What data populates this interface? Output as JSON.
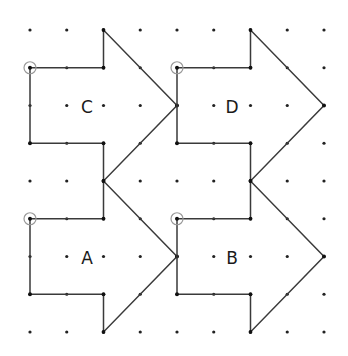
{
  "diagram": {
    "type": "dot-grid-shapes",
    "grid": {
      "columns": 9,
      "rows": 9,
      "origin_px": [
        30,
        30
      ],
      "step_px": [
        36.75,
        37.75
      ],
      "dot_color": "#222222"
    },
    "line_color": "#3a3a3a",
    "marker_color": "#9a9a9a",
    "shapes": [
      {
        "label": "C",
        "marker_vertex": [
          0,
          1
        ],
        "label_pos": [
          1.55,
          2
        ],
        "vertices": [
          [
            0,
            1
          ],
          [
            2,
            1
          ],
          [
            2,
            0
          ],
          [
            4,
            2
          ],
          [
            2,
            4
          ],
          [
            2,
            3
          ],
          [
            0,
            3
          ]
        ]
      },
      {
        "label": "D",
        "marker_vertex": [
          4,
          1
        ],
        "label_pos": [
          5.5,
          2
        ],
        "vertices": [
          [
            4,
            1
          ],
          [
            6,
            1
          ],
          [
            6,
            0
          ],
          [
            8,
            2
          ],
          [
            6,
            4
          ],
          [
            6,
            3
          ],
          [
            4,
            3
          ]
        ]
      },
      {
        "label": "A",
        "marker_vertex": [
          0,
          5
        ],
        "label_pos": [
          1.55,
          6
        ],
        "vertices": [
          [
            0,
            5
          ],
          [
            2,
            5
          ],
          [
            2,
            4
          ],
          [
            4,
            6
          ],
          [
            2,
            8
          ],
          [
            2,
            7
          ],
          [
            0,
            7
          ]
        ]
      },
      {
        "label": "B",
        "marker_vertex": [
          4,
          5
        ],
        "label_pos": [
          5.5,
          6
        ],
        "vertices": [
          [
            4,
            5
          ],
          [
            6,
            5
          ],
          [
            6,
            4
          ],
          [
            8,
            6
          ],
          [
            6,
            8
          ],
          [
            6,
            7
          ],
          [
            4,
            7
          ]
        ]
      }
    ]
  }
}
